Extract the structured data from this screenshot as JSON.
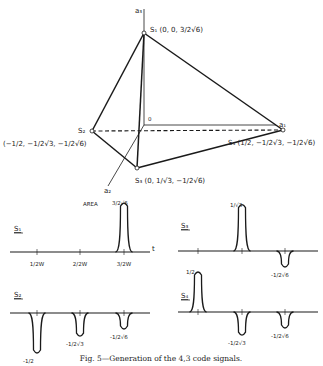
{
  "tetrahedron": {
    "axes": {
      "a1": "a₁",
      "a2": "a₂",
      "a3": "a₃",
      "origin": "0"
    },
    "vertices": [
      {
        "id": "S1",
        "label": "S₁",
        "coords": [
          "0",
          "0",
          "3/(2√6)"
        ]
      },
      {
        "id": "S2",
        "label": "S₂",
        "coords": [
          "-1/2",
          "-1/(2√3)",
          "-1/(2√6)"
        ]
      },
      {
        "id": "S3",
        "label": "S₃",
        "coords": [
          "0",
          "1/√3",
          "-1/(2√6)"
        ]
      },
      {
        "id": "S4",
        "label": "S₄",
        "coords": [
          "1/2",
          "-1/(2√3)",
          "-1/(2√6)"
        ]
      }
    ],
    "text": {
      "s1": "S₁ (0, 0, 3/2√6)",
      "s2_name": "S₂",
      "s2_coords": "(−1/2, −1/2√3, −1/2√6)",
      "s3": "S₃ (0, 1/√3, −1/2√6)",
      "s4": "S₄ (1/2, −1/2√3, −1/2√6)"
    }
  },
  "signals": {
    "time_axis_label": "t",
    "tick_labels": [
      "1/2W",
      "2/2W",
      "3/2W"
    ],
    "area_label": "AREA",
    "plots": [
      {
        "name": "S₁",
        "pulses": [
          {
            "slot": 3,
            "value": "3/2√6",
            "sign": 1,
            "height": 0.61
          }
        ]
      },
      {
        "name": "S₃",
        "pulses": [
          {
            "slot": 2,
            "value": "1/√3",
            "sign": 1,
            "height": 0.58
          },
          {
            "slot": 3,
            "value": "-1/2√6",
            "sign": -1,
            "height": 0.2
          }
        ]
      },
      {
        "name": "S₂",
        "pulses": [
          {
            "slot": 1,
            "value": "-1/2",
            "sign": -1,
            "height": 0.5
          },
          {
            "slot": 2,
            "value": "-1/2√3",
            "sign": -1,
            "height": 0.29
          },
          {
            "slot": 3,
            "value": "-1/2√6",
            "sign": -1,
            "height": 0.2
          }
        ]
      },
      {
        "name": "S₄",
        "pulses": [
          {
            "slot": 1,
            "value": "1/2",
            "sign": 1,
            "height": 0.5
          },
          {
            "slot": 2,
            "value": "-1/2√3",
            "sign": -1,
            "height": 0.29
          },
          {
            "slot": 3,
            "value": "-1/2√6",
            "sign": -1,
            "height": 0.2
          }
        ]
      }
    ]
  },
  "caption": "Fig. 5—Generation of the 4,3 code signals."
}
